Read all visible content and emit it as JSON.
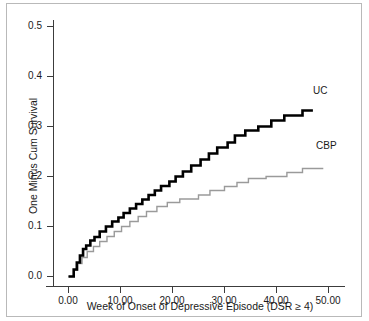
{
  "chart_data": {
    "type": "line",
    "subtype": "step-survival",
    "title": "",
    "xlabel": "Week of Onset of Depressive Episode (DSR ≥ 4)",
    "ylabel": "One Minus Cum Survival",
    "xlim": [
      -1.5,
      55
    ],
    "ylim": [
      -0.02,
      0.53
    ],
    "xticks": [
      0,
      10,
      20,
      30,
      40,
      50
    ],
    "xtick_labels": [
      "0.00",
      "10.00",
      "20.00",
      "30.00",
      "40.00",
      "50.00"
    ],
    "yticks": [
      0.0,
      0.1,
      0.2,
      0.3,
      0.4,
      0.5
    ],
    "ytick_labels": [
      "0.0",
      "0.1",
      "0.2",
      "0.3",
      "0.4",
      "0.5"
    ],
    "grid": false,
    "legend_position": "inline-right-of-curves",
    "series": [
      {
        "name": "UC",
        "label": "UC",
        "color": "#000000",
        "line_width": 2.6,
        "points": [
          [
            0.0,
            0.0
          ],
          [
            1.0,
            0.0
          ],
          [
            1.0,
            0.014
          ],
          [
            1.6,
            0.014
          ],
          [
            1.6,
            0.028
          ],
          [
            2.2,
            0.028
          ],
          [
            2.2,
            0.042
          ],
          [
            2.8,
            0.042
          ],
          [
            2.8,
            0.055
          ],
          [
            3.4,
            0.055
          ],
          [
            3.4,
            0.062
          ],
          [
            4.2,
            0.062
          ],
          [
            4.2,
            0.072
          ],
          [
            5.0,
            0.072
          ],
          [
            5.0,
            0.079
          ],
          [
            6.0,
            0.079
          ],
          [
            6.0,
            0.09
          ],
          [
            7.2,
            0.09
          ],
          [
            7.2,
            0.1
          ],
          [
            8.4,
            0.1
          ],
          [
            8.4,
            0.11
          ],
          [
            9.6,
            0.11
          ],
          [
            9.6,
            0.118
          ],
          [
            10.6,
            0.118
          ],
          [
            10.6,
            0.127
          ],
          [
            11.8,
            0.127
          ],
          [
            11.8,
            0.136
          ],
          [
            13.0,
            0.136
          ],
          [
            13.0,
            0.145
          ],
          [
            14.2,
            0.145
          ],
          [
            14.2,
            0.154
          ],
          [
            15.4,
            0.154
          ],
          [
            15.4,
            0.163
          ],
          [
            16.6,
            0.163
          ],
          [
            16.6,
            0.172
          ],
          [
            17.8,
            0.172
          ],
          [
            17.8,
            0.181
          ],
          [
            19.4,
            0.181
          ],
          [
            19.4,
            0.19
          ],
          [
            20.6,
            0.19
          ],
          [
            20.6,
            0.2
          ],
          [
            22.0,
            0.2
          ],
          [
            22.0,
            0.21
          ],
          [
            23.6,
            0.21
          ],
          [
            23.6,
            0.222
          ],
          [
            25.4,
            0.222
          ],
          [
            25.4,
            0.234
          ],
          [
            27.0,
            0.234
          ],
          [
            27.0,
            0.246
          ],
          [
            28.6,
            0.246
          ],
          [
            28.6,
            0.258
          ],
          [
            30.6,
            0.258
          ],
          [
            30.6,
            0.268
          ],
          [
            32.0,
            0.268
          ],
          [
            32.0,
            0.282
          ],
          [
            34.0,
            0.282
          ],
          [
            34.0,
            0.292
          ],
          [
            36.5,
            0.292
          ],
          [
            36.5,
            0.3
          ],
          [
            39.0,
            0.3
          ],
          [
            39.0,
            0.312
          ],
          [
            41.5,
            0.312
          ],
          [
            41.5,
            0.322
          ],
          [
            45.0,
            0.322
          ],
          [
            45.0,
            0.332
          ],
          [
            47.0,
            0.332
          ]
        ]
      },
      {
        "name": "CBP",
        "label": "CBP",
        "color": "#9a9a9a",
        "line_width": 1.4,
        "points": [
          [
            0.0,
            0.0
          ],
          [
            1.0,
            0.0
          ],
          [
            1.0,
            0.013
          ],
          [
            1.8,
            0.013
          ],
          [
            1.8,
            0.026
          ],
          [
            2.6,
            0.026
          ],
          [
            2.6,
            0.038
          ],
          [
            3.6,
            0.038
          ],
          [
            3.6,
            0.05
          ],
          [
            4.8,
            0.05
          ],
          [
            4.8,
            0.06
          ],
          [
            6.0,
            0.06
          ],
          [
            6.0,
            0.07
          ],
          [
            7.4,
            0.07
          ],
          [
            7.4,
            0.08
          ],
          [
            8.8,
            0.08
          ],
          [
            8.8,
            0.09
          ],
          [
            10.2,
            0.09
          ],
          [
            10.2,
            0.1
          ],
          [
            11.8,
            0.1
          ],
          [
            11.8,
            0.11
          ],
          [
            13.4,
            0.11
          ],
          [
            13.4,
            0.12
          ],
          [
            15.0,
            0.12
          ],
          [
            15.0,
            0.13
          ],
          [
            17.0,
            0.13
          ],
          [
            17.0,
            0.14
          ],
          [
            19.0,
            0.14
          ],
          [
            19.0,
            0.148
          ],
          [
            21.4,
            0.148
          ],
          [
            21.4,
            0.155
          ],
          [
            25.0,
            0.155
          ],
          [
            25.0,
            0.163
          ],
          [
            27.2,
            0.163
          ],
          [
            27.2,
            0.172
          ],
          [
            30.0,
            0.172
          ],
          [
            30.0,
            0.18
          ],
          [
            32.4,
            0.18
          ],
          [
            32.4,
            0.188
          ],
          [
            34.6,
            0.188
          ],
          [
            34.6,
            0.196
          ],
          [
            38.0,
            0.196
          ],
          [
            38.0,
            0.2
          ],
          [
            42.0,
            0.2
          ],
          [
            42.0,
            0.208
          ],
          [
            45.0,
            0.208
          ],
          [
            45.0,
            0.216
          ],
          [
            49.0,
            0.216
          ]
        ]
      }
    ]
  },
  "axes": {
    "ylabel": "One Minus Cum Survival",
    "xlabel": "Week of Onset of Depressive Episode (DSR ≥ 4)",
    "ytick_labels": [
      "0.5",
      "0.4",
      "0.3",
      "0.2",
      "0.1",
      "0.0"
    ],
    "xtick_labels": [
      "0.00",
      "10.00",
      "20.00",
      "30.00",
      "40.00",
      "50.00"
    ]
  },
  "legend": {
    "uc": "UC",
    "cbp": "CBP"
  },
  "colors": {
    "uc_line": "#000000",
    "cbp_line": "#9a9a9a",
    "axis": "#3c3c3c",
    "frame": "#b9b9b9",
    "text": "#1a1a1a",
    "background": "#ffffff"
  }
}
